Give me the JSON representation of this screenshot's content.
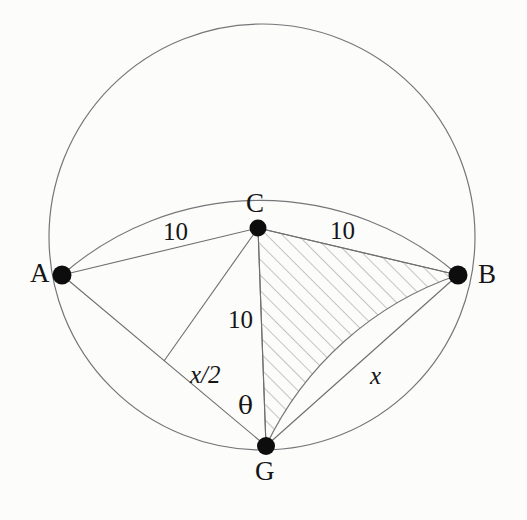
{
  "figure": {
    "kind": "geometry-diagram",
    "background_color": "#fcfcfa",
    "stroke_color": "#6e6e70",
    "hatch_color": "#8a8a8c",
    "vertex_color": "#101010",
    "label_color": "#161616"
  },
  "points": [
    {
      "id": "A",
      "label": "A",
      "cx": 62,
      "cy": 275,
      "label_x": 30,
      "label_y": 260
    },
    {
      "id": "B",
      "label": "B",
      "cx": 458,
      "cy": 275,
      "label_x": 478,
      "label_y": 261
    },
    {
      "id": "C",
      "label": "C",
      "cx": 258,
      "cy": 228,
      "label_x": 246,
      "label_y": 190
    },
    {
      "id": "G",
      "label": "G",
      "cx": 266,
      "cy": 446,
      "label_x": 255,
      "label_y": 458
    }
  ],
  "labels": [
    {
      "id": "len-AC",
      "text": "10",
      "style": "measure",
      "x": 163,
      "y": 219
    },
    {
      "id": "len-CB",
      "text": "10",
      "style": "measure",
      "x": 330,
      "y": 218
    },
    {
      "id": "len-CG",
      "text": "10",
      "style": "measure",
      "x": 228,
      "y": 307
    },
    {
      "id": "len-half",
      "text": "x/2",
      "style": "var",
      "x": 190,
      "y": 362
    },
    {
      "id": "len-GB",
      "text": "x",
      "style": "var",
      "x": 370,
      "y": 363
    },
    {
      "id": "angle-G",
      "text": "θ",
      "style": "greek",
      "x": 238,
      "y": 393
    }
  ],
  "circles": [
    {
      "id": "outer-circle",
      "cx": 262,
      "cy": 237,
      "r": 213
    }
  ],
  "arcs": [
    {
      "id": "arc-A-C-B",
      "from": "A",
      "to": "B",
      "through": "C",
      "sweep": "upper"
    },
    {
      "id": "arc-G-B",
      "from": "G",
      "to": "B",
      "sweep": "right"
    }
  ],
  "segments": [
    {
      "id": "seg-A-C",
      "from": "A",
      "to": "C"
    },
    {
      "id": "seg-C-B",
      "from": "C",
      "to": "B"
    },
    {
      "id": "seg-C-G",
      "from": "C",
      "to": "G"
    },
    {
      "id": "seg-A-G",
      "from": "A",
      "to": "G"
    },
    {
      "id": "seg-G-B",
      "from": "G",
      "to": "B"
    },
    {
      "id": "seg-C-M",
      "from": "C",
      "to": "midpoint-AG"
    }
  ],
  "hatched_region": {
    "id": "region-CBG",
    "vertices": [
      "C",
      "B",
      "G"
    ],
    "fill": "diagonal-hatch",
    "angle_deg": 45
  }
}
